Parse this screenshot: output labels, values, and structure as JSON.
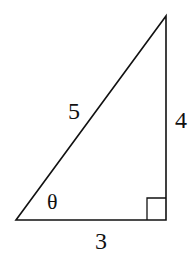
{
  "diagram": {
    "type": "right-triangle",
    "labels": {
      "hypotenuse": "5",
      "vertical_leg": "4",
      "horizontal_leg": "3",
      "angle": "θ"
    },
    "right_angle_marker": true,
    "colors": {
      "stroke": "#111111",
      "background": "#ffffff"
    }
  }
}
